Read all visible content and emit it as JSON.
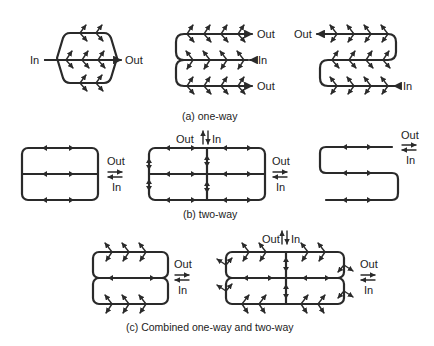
{
  "figure": {
    "panel_a": {
      "caption": "(a) one-way",
      "diagram1": {
        "in_label": "In",
        "out_label": "Out"
      },
      "diagram2": {
        "out_top_label": "Out",
        "in_label": "In",
        "out_bottom_label": "Out"
      },
      "diagram3": {
        "out_label": "Out",
        "in_label": "In"
      }
    },
    "panel_b": {
      "caption": "(b) two-way",
      "diagram1": {
        "out_label": "Out",
        "in_label": "In"
      },
      "diagram2": {
        "top_out_label": "Out",
        "top_in_label": "In",
        "side_out_label": "Out",
        "side_in_label": "In"
      },
      "diagram3": {
        "out_label": "Out",
        "in_label": "In"
      }
    },
    "panel_c": {
      "caption": "(c) Combined one-way and two-way",
      "diagram1": {
        "out_label": "Out",
        "in_label": "In"
      },
      "diagram2": {
        "top_out_label": "Out",
        "top_in_label": "In",
        "side_out_label": "Out",
        "side_in_label": "In"
      }
    },
    "colors": {
      "line": "#2a2a2a",
      "background": "#ffffff"
    }
  }
}
